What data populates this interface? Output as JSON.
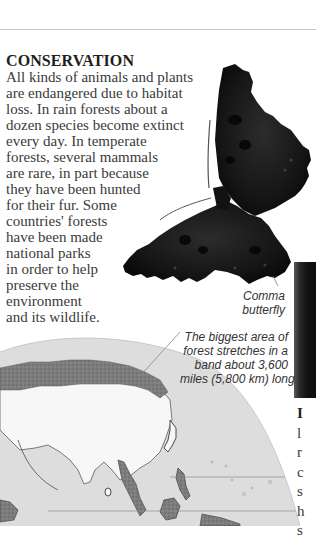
{
  "page": {
    "type": "book-page-spread-fragment"
  },
  "conservation": {
    "heading": "CONSERVATION",
    "lines": [
      "All kinds of animals and plants",
      "are endangered due to habitat",
      "loss. In rain forests about a",
      "dozen species become extinct",
      "every day. In temperate",
      "forests, several mammals",
      "are rare, in part because",
      "they have been hunted",
      "for their fur. Some",
      "countries' forests",
      "have been made",
      "national parks",
      "in order to help",
      "preserve the",
      "environment",
      "and its wildlife."
    ]
  },
  "butterfly": {
    "image": "comma-butterfly-photo",
    "caption_lines": [
      "Comma",
      "butterfly"
    ]
  },
  "map": {
    "image": "globe-map-asia-forests",
    "caption_lines": [
      "The biggest area of",
      "forest stretches in a",
      "band about 3,600",
      "miles (5,800 km) long."
    ],
    "colors": {
      "ocean": "#dcdcdc",
      "land": "#f7f7f7",
      "forest": "#7a7a7a",
      "coast": "#555555",
      "gridline": "#8a8a8a"
    }
  },
  "right_column": {
    "image": "dark-photo-strip",
    "lines": [
      "I",
      "l",
      "r",
      "c",
      "s",
      "h",
      "s"
    ]
  }
}
